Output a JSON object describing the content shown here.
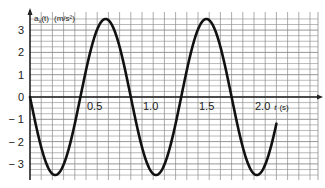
{
  "chart_data": {
    "type": "line",
    "title": "",
    "xlabel": "t (s)",
    "ylabel": "a_x(t) (m/s²)",
    "ylabel_parts": {
      "main": "a",
      "sub": "x",
      "arg": "(t)",
      "unit": "(m/s²)"
    },
    "xlabel_parts": {
      "main": "t",
      "unit": "(s)"
    },
    "xlim": [
      0,
      2.5
    ],
    "ylim": [
      -3.8,
      3.6
    ],
    "grid": true,
    "x_ticks": [
      0.5,
      1.0,
      1.5,
      2.0
    ],
    "x_tick_labels": [
      "0.5",
      "1.0",
      "1.5",
      "2.0"
    ],
    "y_ticks": [
      3,
      2,
      1,
      0,
      -1,
      -2,
      -3
    ],
    "y_tick_labels": [
      "3",
      "2",
      "1",
      "0",
      "− 1",
      "− 2",
      "− 3"
    ],
    "series": [
      {
        "name": "a_x(t)",
        "function": "a(t) = -3.5 * sin(2*pi*t/0.9)",
        "amplitude": 3.5,
        "period": 0.9,
        "t_range": [
          0,
          2.2
        ],
        "x": [
          0,
          0.225,
          0.45,
          0.675,
          0.9,
          1.125,
          1.35,
          1.575,
          1.8,
          2.0,
          2.2
        ],
        "y": [
          0,
          -3.5,
          0,
          3.5,
          0,
          -3.5,
          0,
          3.5,
          0,
          -2.25,
          -3.45
        ]
      }
    ],
    "legend": null
  },
  "plot": {
    "origin_px": {
      "x": 30,
      "y": 97
    },
    "px_per_second": 112,
    "px_per_unit": 22.3,
    "right_edge_px": 318,
    "top_px": 12,
    "bottom_px": 180,
    "line_color": "#111111",
    "grid_color": "#8a8a8a",
    "axis_color": "#222222"
  }
}
